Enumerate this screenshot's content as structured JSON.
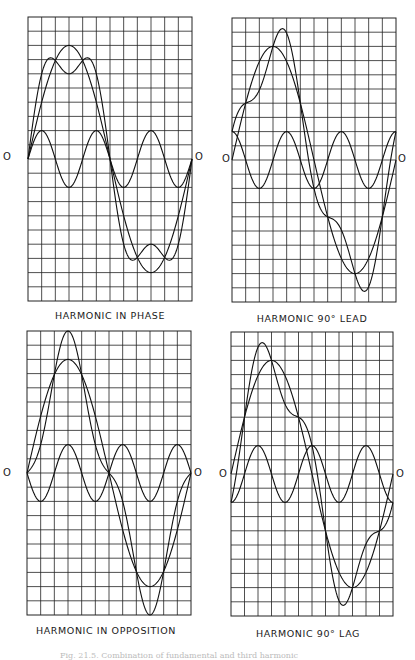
{
  "figure": {
    "caption": "Fig. 21.5. Combination of fundamental and third harmonic"
  },
  "chart_data": [
    {
      "type": "line",
      "title": "HARMONIC IN PHASE",
      "zero_label": "O",
      "grid": {
        "columns": 12,
        "rows": 20,
        "on": true
      },
      "x": [
        0,
        30,
        60,
        90,
        120,
        150,
        180,
        210,
        240,
        270,
        300,
        330,
        360
      ],
      "xlabel": "",
      "ylabel": "",
      "ylim": [
        -10,
        10
      ],
      "series": [
        {
          "name": "Fundamental",
          "amplitude": 8,
          "harmonic_order": 1,
          "phase_deg": 0,
          "values": [
            0,
            4,
            6.93,
            8,
            6.93,
            4,
            0,
            -4,
            -6.93,
            -8,
            -6.93,
            -4,
            0
          ]
        },
        {
          "name": "Third harmonic",
          "amplitude": 2,
          "harmonic_order": 3,
          "phase_deg": 0,
          "values": [
            0,
            2,
            0,
            -2,
            0,
            2,
            0,
            -2,
            0,
            2,
            0,
            -2,
            0
          ]
        },
        {
          "name": "Resultant",
          "values": [
            0,
            6,
            6.93,
            6,
            6.93,
            6,
            0,
            -6,
            -6.93,
            -6,
            -6.93,
            -6,
            0
          ]
        }
      ]
    },
    {
      "type": "line",
      "title": "HARMONIC 90° LEAD",
      "zero_label": "O",
      "grid": {
        "columns": 12,
        "rows": 20,
        "on": true
      },
      "x": [
        0,
        30,
        60,
        90,
        120,
        150,
        180,
        210,
        240,
        270,
        300,
        330,
        360
      ],
      "xlabel": "",
      "ylabel": "",
      "ylim": [
        -10,
        10
      ],
      "series": [
        {
          "name": "Fundamental",
          "amplitude": 8,
          "harmonic_order": 1,
          "phase_deg": 0,
          "values": [
            0,
            4,
            6.93,
            8,
            6.93,
            4,
            0,
            -4,
            -6.93,
            -8,
            -6.93,
            -4,
            0
          ]
        },
        {
          "name": "Third harmonic",
          "amplitude": 2,
          "harmonic_order": 3,
          "phase_deg": 90,
          "values": [
            2,
            0,
            -2,
            0,
            2,
            0,
            -2,
            0,
            2,
            0,
            -2,
            0,
            2
          ]
        },
        {
          "name": "Resultant",
          "values": [
            2,
            4,
            4.93,
            8,
            8.93,
            4,
            -2,
            -4,
            -4.93,
            -8,
            -8.93,
            -4,
            2
          ]
        }
      ]
    },
    {
      "type": "line",
      "title": "HARMONIC IN OPPOSITION",
      "zero_label": "O",
      "grid": {
        "columns": 12,
        "rows": 20,
        "on": true
      },
      "x": [
        0,
        30,
        60,
        90,
        120,
        150,
        180,
        210,
        240,
        270,
        300,
        330,
        360
      ],
      "xlabel": "",
      "ylabel": "",
      "ylim": [
        -10,
        10
      ],
      "series": [
        {
          "name": "Fundamental",
          "amplitude": 8,
          "harmonic_order": 1,
          "phase_deg": 0,
          "values": [
            0,
            4,
            6.93,
            8,
            6.93,
            4,
            0,
            -4,
            -6.93,
            -8,
            -6.93,
            -4,
            0
          ]
        },
        {
          "name": "Third harmonic",
          "amplitude": 2,
          "harmonic_order": 3,
          "phase_deg": 180,
          "values": [
            0,
            -2,
            0,
            2,
            0,
            -2,
            0,
            2,
            0,
            -2,
            0,
            2,
            0
          ]
        },
        {
          "name": "Resultant",
          "values": [
            0,
            2,
            6.93,
            10,
            6.93,
            2,
            0,
            -2,
            -6.93,
            -10,
            -6.93,
            -2,
            0
          ]
        }
      ]
    },
    {
      "type": "line",
      "title": "HARMONIC 90° LAG",
      "zero_label": "O",
      "grid": {
        "columns": 12,
        "rows": 20,
        "on": true
      },
      "x": [
        0,
        30,
        60,
        90,
        120,
        150,
        180,
        210,
        240,
        270,
        300,
        330,
        360
      ],
      "xlabel": "",
      "ylabel": "",
      "ylim": [
        -10,
        10
      ],
      "series": [
        {
          "name": "Fundamental",
          "amplitude": 8,
          "harmonic_order": 1,
          "phase_deg": 0,
          "values": [
            0,
            4,
            6.93,
            8,
            6.93,
            4,
            0,
            -4,
            -6.93,
            -8,
            -6.93,
            -4,
            0
          ]
        },
        {
          "name": "Third harmonic",
          "amplitude": 2,
          "harmonic_order": 3,
          "phase_deg": -90,
          "values": [
            -2,
            0,
            2,
            0,
            -2,
            0,
            2,
            0,
            -2,
            0,
            2,
            0,
            -2
          ]
        },
        {
          "name": "Resultant",
          "values": [
            -2,
            4,
            8.93,
            8,
            4.93,
            4,
            2,
            -4,
            -8.93,
            -8,
            -4.93,
            -4,
            -2
          ]
        }
      ]
    }
  ]
}
